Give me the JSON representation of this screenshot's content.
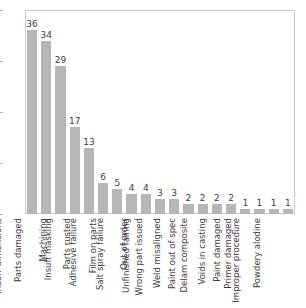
{
  "chart_data": {
    "type": "bar",
    "title": "",
    "subtitle": "",
    "xlabel": "",
    "ylabel": "",
    "ylim": [
      0,
      40
    ],
    "yticks": [
      0,
      10,
      20,
      30,
      40
    ],
    "grid": false,
    "legend": "none",
    "bar_color": "#b6b6b6",
    "frame_color": "#c9c9c9",
    "categories": [
      "Incorr dimensions",
      "Parts damaged",
      "Machining",
      "Insuff masking",
      "Parts rusted",
      "Adhesive failure",
      "Film on parts",
      "Salt spray failure",
      "Out of order",
      "Unfinished fairing",
      "Wrong part issued",
      "Weld misaligned",
      "Paint out of spec",
      "Delam composite",
      "Voids in casting",
      "Paint damaged",
      "Primer damaged",
      "Improper procedure",
      "Powdery alodine"
    ],
    "values": [
      36,
      34,
      29,
      17,
      13,
      6,
      5,
      4,
      4,
      3,
      3,
      2,
      2,
      2,
      2,
      1,
      1,
      1,
      1
    ],
    "data_labels": [
      "36",
      "34",
      "29",
      "17",
      "13",
      "6",
      "5",
      "4",
      "4",
      "3",
      "3",
      "2",
      "2",
      "2",
      "2",
      "1",
      "1",
      "1",
      "1"
    ],
    "ytick_labels": [
      "0",
      "10",
      "20",
      "30",
      "40"
    ]
  }
}
